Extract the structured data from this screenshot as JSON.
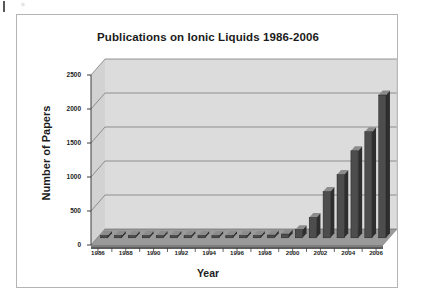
{
  "chart_data": {
    "type": "bar",
    "title": "Publications on Ionic Liquids 1986-2006",
    "xlabel": "Year",
    "ylabel": "Number of Papers",
    "categories": [
      "1986",
      "1987",
      "1988",
      "1989",
      "1990",
      "1991",
      "1992",
      "1993",
      "1994",
      "1995",
      "1996",
      "1997",
      "1998",
      "1999",
      "2000",
      "2001",
      "2002",
      "2003",
      "2004",
      "2005",
      "2006"
    ],
    "values": [
      10,
      12,
      14,
      12,
      16,
      15,
      18,
      20,
      22,
      24,
      28,
      30,
      40,
      55,
      120,
      300,
      680,
      930,
      1280,
      1560,
      2100
    ],
    "ylim": [
      0,
      2500
    ],
    "yticks": [
      0,
      500,
      1000,
      1500,
      2000,
      2500
    ],
    "ytick_labels": [
      "0",
      "500",
      "1000",
      "1500",
      "2000",
      "2500"
    ],
    "xtick_labels": [
      "1986",
      "1988",
      "1990",
      "1992",
      "1994",
      "1996",
      "1998",
      "2000",
      "2002",
      "2004",
      "2006"
    ],
    "grid": "horizontal",
    "legend": "none",
    "style": "3d-column",
    "colors": {
      "bar_front": "#4d4d4d",
      "bar_top": "#8c8c8c",
      "bar_side": "#2e2e2e",
      "plot_wall": "#dcdcdc",
      "plot_floor": "#9a9a9a",
      "gridline": "#6e6e6e",
      "axis": "#4a4a4a",
      "frame": "#b4b4b4",
      "text": "#1b1b1b"
    }
  }
}
